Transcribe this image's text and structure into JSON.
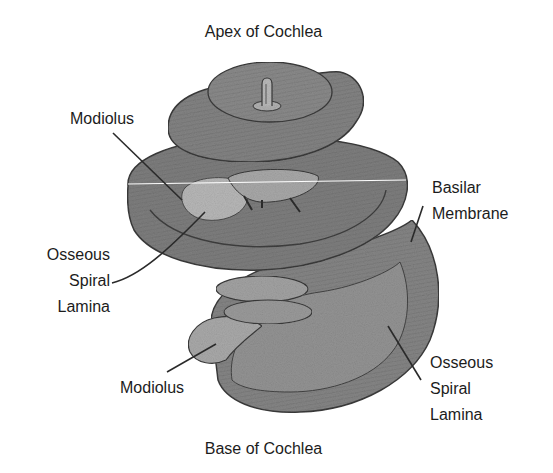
{
  "diagram": {
    "subject": "Cochlea",
    "title_top": "Apex of Cochlea",
    "title_bottom": "Base of Cochlea",
    "labels": {
      "modiolus_top": "Modiolus",
      "osseous_spiral_lamina_left": {
        "line1": "Osseous",
        "line2": "Spiral",
        "line3": "Lamina"
      },
      "basilar_membrane": {
        "line1": "Basilar",
        "line2": "Membrane"
      },
      "osseous_spiral_lamina_right": {
        "line1": "Osseous",
        "line2": "Spiral",
        "line3": "Lamina"
      },
      "modiolus_bottom": "Modiolus"
    },
    "colors": {
      "background": "#ffffff",
      "text": "#1c1c1c",
      "turn_fill_dark": "#7a7a7a",
      "turn_fill_mid": "#8e8e8e",
      "lamina_fill_light": "#b4b4b4",
      "outline": "#3a3a3a",
      "leader_line": "#2a2a2a"
    }
  }
}
